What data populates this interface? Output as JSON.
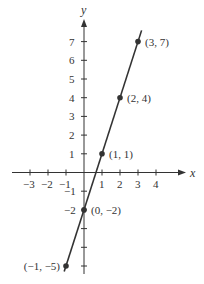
{
  "chart_data": {
    "type": "line",
    "title": "",
    "xlabel": "x",
    "ylabel": "y",
    "xlim": [
      -3.5,
      4.8
    ],
    "ylim": [
      -5.8,
      7.8
    ],
    "x_ticks": [
      -3,
      -2,
      -1,
      1,
      2,
      3,
      4
    ],
    "y_ticks": [
      -5,
      -4,
      -3,
      -2,
      -1,
      1,
      2,
      3,
      4,
      5,
      6,
      7
    ],
    "x_tick_labels": [
      "−3",
      "−2",
      "−1",
      "1",
      "2",
      "3",
      "4"
    ],
    "y_tick_labels": [
      "",
      "",
      "",
      "−2",
      "−1",
      "1",
      "2",
      "3",
      "4",
      "5",
      "6",
      "7"
    ],
    "grid": false,
    "series": [
      {
        "name": "y = 3x − 2",
        "line": {
          "x_start": -1.1,
          "x_end": 3.2
        },
        "points": [
          {
            "x": -1,
            "y": -5,
            "label": "(−1, −5)"
          },
          {
            "x": 0,
            "y": -2,
            "label": "(0, −2)"
          },
          {
            "x": 1,
            "y": 1,
            "label": "(1, 1)"
          },
          {
            "x": 2,
            "y": 4,
            "label": "(2, 4)"
          },
          {
            "x": 3,
            "y": 7,
            "label": "(3, 7)"
          }
        ]
      }
    ],
    "colors": {
      "line": "#333333",
      "axis": "#333333",
      "background": "#ffffff"
    }
  }
}
